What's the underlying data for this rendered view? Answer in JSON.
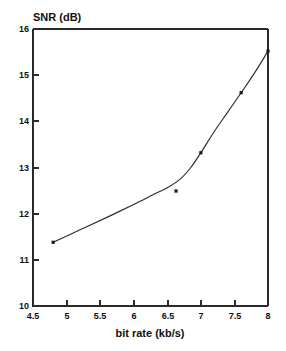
{
  "chart_data": {
    "type": "line",
    "title": "",
    "xlabel": "bit rate (kb/s)",
    "ylabel": "SNR (dB)",
    "xlim": [
      4.5,
      8.0
    ],
    "ylim": [
      10,
      16
    ],
    "xticks": [
      "4.5",
      "5",
      "5.5",
      "6",
      "6.5",
      "7",
      "7.5",
      "8"
    ],
    "xtick_values": [
      4.5,
      5,
      5.5,
      6,
      6.5,
      7,
      7.5,
      8
    ],
    "yticks": [
      "10",
      "11",
      "12",
      "13",
      "14",
      "15",
      "16"
    ],
    "ytick_values": [
      10,
      11,
      12,
      13,
      14,
      15,
      16
    ],
    "grid": false,
    "legend": false,
    "series": [
      {
        "name": "SNR",
        "marker": "square",
        "line": "solid",
        "x": [
          4.8,
          6.63,
          7.0,
          7.6,
          8.0
        ],
        "y": [
          11.38,
          12.49,
          13.32,
          14.62,
          15.52
        ]
      }
    ],
    "curve_points": {
      "x": [
        4.8,
        5.2,
        5.6,
        6.0,
        6.3,
        6.5,
        6.7,
        6.85,
        7.0,
        7.2,
        7.4,
        7.6,
        7.8,
        8.0
      ],
      "y": [
        11.38,
        11.65,
        11.92,
        12.2,
        12.42,
        12.56,
        12.76,
        13.0,
        13.32,
        13.78,
        14.2,
        14.62,
        15.05,
        15.52
      ]
    },
    "annotations": []
  },
  "figure": {
    "background_color": "#ffffff",
    "axis_color": "#2a2a2a",
    "line_color": "#2b2b2b",
    "marker_color": "#1a1a1a"
  }
}
